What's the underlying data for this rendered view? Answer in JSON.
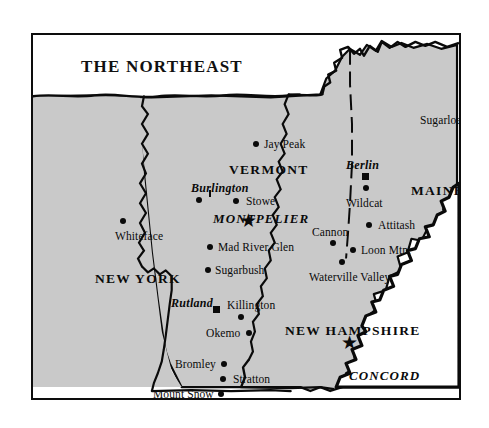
{
  "title": "THE NORTHEAST",
  "colors": {
    "land_fill": "#c9c9c9",
    "ocean_fill": "#ffffff",
    "ink": "#0a0a0a",
    "frame": "#0d0d0d"
  },
  "states": [
    {
      "name": "VERMONT",
      "x": 196,
      "y": 128
    },
    {
      "name": "MAINE",
      "x": 378,
      "y": 149
    },
    {
      "name": "NEW YORK",
      "x": 62,
      "y": 237
    },
    {
      "name": "NEW HAMPSHIRE",
      "x": 252,
      "y": 289
    }
  ],
  "capitals": [
    {
      "name": "MONTPELIER",
      "x": 180,
      "y": 177,
      "marker": "star",
      "marker_x": 216,
      "marker_y": 192
    },
    {
      "name": "CONCORD",
      "x": 316,
      "y": 334,
      "marker": "star",
      "marker_x": 317,
      "marker_y": 314
    }
  ],
  "cities": [
    {
      "name": "Burlington",
      "x": 158,
      "y": 147,
      "marker": "dot",
      "marker_x": 163,
      "marker_y": 162,
      "tick_x": 176,
      "tick_y": 155
    },
    {
      "name": "Berlin",
      "x": 313,
      "y": 124,
      "marker": "square",
      "marker_x": 329,
      "marker_y": 138
    },
    {
      "name": "Rutland",
      "x": 138,
      "y": 262,
      "marker": "square",
      "marker_x": 180,
      "marker_y": 271
    }
  ],
  "resorts": [
    {
      "name": "Jay Peak",
      "x": 231,
      "y": 104,
      "marker_x": 220,
      "marker_y": 106
    },
    {
      "name": "Sugarloaf",
      "x": 387,
      "y": 80,
      "marker_x": 447,
      "marker_y": 82
    },
    {
      "name": "Stowe",
      "x": 213,
      "y": 161,
      "marker_x": 200,
      "marker_y": 163
    },
    {
      "name": "Wildcat",
      "x": 313,
      "y": 163,
      "marker_x": 330,
      "marker_y": 150
    },
    {
      "name": "Whiteface",
      "x": 82,
      "y": 196,
      "marker_x": 87,
      "marker_y": 183
    },
    {
      "name": "Attitash",
      "x": 345,
      "y": 185,
      "marker_x": 333,
      "marker_y": 187
    },
    {
      "name": "Cannon",
      "x": 279,
      "y": 192,
      "marker_x": 297,
      "marker_y": 205
    },
    {
      "name": "Mad River Glen",
      "x": 185,
      "y": 207,
      "marker_x": 174,
      "marker_y": 209
    },
    {
      "name": "Loon Mtn.",
      "x": 328,
      "y": 210,
      "marker_x": 317,
      "marker_y": 212
    },
    {
      "name": "Sugarbush",
      "x": 182,
      "y": 230,
      "marker_x": 172,
      "marker_y": 232
    },
    {
      "name": "Waterville Valley",
      "x": 276,
      "y": 237,
      "marker_x": 306,
      "marker_y": 224
    },
    {
      "name": "Killington",
      "x": 194,
      "y": 265,
      "marker_x": 205,
      "marker_y": 279
    },
    {
      "name": "Okemo",
      "x": 173,
      "y": 293,
      "marker_x": 213,
      "marker_y": 295
    },
    {
      "name": "Bromley",
      "x": 142,
      "y": 324,
      "marker_x": 188,
      "marker_y": 326
    },
    {
      "name": "Stratton",
      "x": 200,
      "y": 339,
      "marker_x": 187,
      "marker_y": 341
    },
    {
      "name": "Mount Snow",
      "x": 120,
      "y": 354,
      "marker_x": 185,
      "marker_y": 356
    }
  ]
}
